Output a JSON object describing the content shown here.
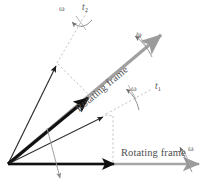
{
  "figure": {
    "type": "vector-diagram",
    "background_color": "#ffffff"
  },
  "labels": {
    "omega_top": "ω",
    "omega_upper_right": "ω",
    "omega_middle": "ω",
    "omega_bottom_right": "ω",
    "t_two": "t",
    "t_two_sub": "2",
    "t_one": "t",
    "t_one_sub": "1",
    "rotating_frame_diagonal": "Rotating frame",
    "rotating_frame_horizontal": "Rotating frame"
  },
  "colors": {
    "vector_black": "#1a1a1a",
    "vector_thin": "#333333",
    "axis_gray": "#9b9b9b",
    "dash_gray": "#b5b5b5",
    "arc_gray": "#8c8c8c",
    "text_gray": "#555555"
  },
  "geometry": {
    "origin": {
      "x": 8,
      "y": 164
    },
    "vectors": [
      {
        "name": "thin-steep-vector",
        "angle_deg": 62,
        "length": 112,
        "style": "thin-black",
        "tip": {
          "x": 57,
          "y": 62
        }
      },
      {
        "name": "thick-diagonal-vector",
        "angle_deg": 41,
        "length": 105,
        "style": "thick-black",
        "tip": {
          "x": 90,
          "y": 95
        }
      },
      {
        "name": "thin-medium-vector",
        "angle_deg": 27,
        "length": 110,
        "style": "thin-black",
        "tip": {
          "x": 105,
          "y": 115
        }
      },
      {
        "name": "horizontal-vector",
        "angle_deg": 0,
        "length": 108,
        "style": "thick-black",
        "tip": {
          "x": 116,
          "y": 164
        }
      }
    ],
    "frame_axes": [
      {
        "name": "diagonal-rotating-frame-axis",
        "angle_deg": 40,
        "from": {
          "x": 8,
          "y": 164
        },
        "to": {
          "x": 163,
          "y": 33
        }
      },
      {
        "name": "horizontal-rotating-frame-axis",
        "angle_deg": 0,
        "from": {
          "x": 8,
          "y": 164
        },
        "to": {
          "x": 200,
          "y": 164
        }
      }
    ],
    "arcs": [
      {
        "name": "omega-arc-top",
        "center_label": "t2"
      },
      {
        "name": "omega-arc-upper-right",
        "center_label": "diagonal-frame"
      },
      {
        "name": "omega-arc-middle",
        "center_label": "t1"
      },
      {
        "name": "omega-arc-bottom-right",
        "center_label": "horizontal-frame"
      }
    ]
  }
}
